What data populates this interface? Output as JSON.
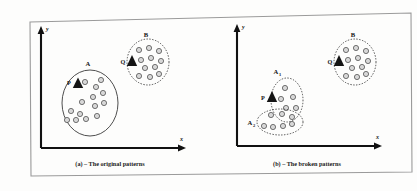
{
  "figure": {
    "outer_border_color": "#9a9a9a",
    "background_color": "#fdfdfc",
    "axis_color": "#111111",
    "dot_fill": "#d8d8d8",
    "dot_stroke": "#4a4a4a",
    "marker_fill": "#141414",
    "cluster_outline_color": "#3a3a3a"
  },
  "panels": [
    {
      "id": "panel-a",
      "caption": "(a) – The original patterns",
      "axes": {
        "y_label": "y",
        "x_label": "x"
      },
      "clusters": [
        {
          "name": "A",
          "shape": "ellipse",
          "outline": "solid",
          "cx": 90,
          "cy": 103,
          "rx": 28,
          "ry": 33,
          "label_x": 88,
          "label_y": 66,
          "points": [
            {
              "x": 85,
              "y": 82
            },
            {
              "x": 96,
              "y": 87
            },
            {
              "x": 101,
              "y": 80
            },
            {
              "x": 103,
              "y": 93
            },
            {
              "x": 93,
              "y": 97
            },
            {
              "x": 82,
              "y": 102
            },
            {
              "x": 95,
              "y": 106
            },
            {
              "x": 104,
              "y": 103
            },
            {
              "x": 71,
              "y": 111
            },
            {
              "x": 80,
              "y": 114
            },
            {
              "x": 67,
              "y": 120
            },
            {
              "x": 76,
              "y": 120
            },
            {
              "x": 86,
              "y": 119
            },
            {
              "x": 97,
              "y": 116
            }
          ],
          "marker": {
            "label": "P",
            "x": 78,
            "y": 83,
            "label_x": 69,
            "label_y": 84
          }
        },
        {
          "name": "B",
          "shape": "ellipse",
          "outline": "dotted",
          "cx": 148,
          "cy": 62,
          "rx": 21,
          "ry": 23,
          "label_x": 146,
          "label_y": 37,
          "points": [
            {
              "x": 139,
              "y": 50
            },
            {
              "x": 149,
              "y": 48
            },
            {
              "x": 159,
              "y": 51
            },
            {
              "x": 141,
              "y": 60
            },
            {
              "x": 151,
              "y": 58
            },
            {
              "x": 161,
              "y": 61
            },
            {
              "x": 145,
              "y": 68
            },
            {
              "x": 155,
              "y": 67
            },
            {
              "x": 139,
              "y": 76
            },
            {
              "x": 150,
              "y": 77
            },
            {
              "x": 159,
              "y": 74
            }
          ],
          "marker": {
            "label": "Q",
            "x": 132,
            "y": 61,
            "label_x": 122,
            "label_y": 63
          }
        }
      ]
    },
    {
      "id": "panel-b",
      "caption": "(b) – The broken patterns",
      "axes": {
        "y_label": "y",
        "x_label": "x"
      },
      "clusters": [
        {
          "name": "A",
          "subscript": "1",
          "shape": "ellipse",
          "outline": "dotted",
          "cx": 287,
          "cy": 100,
          "rx": 16,
          "ry": 22,
          "label_x": 278,
          "label_y": 72,
          "points": [
            {
              "x": 285,
              "y": 88
            },
            {
              "x": 281,
              "y": 99
            },
            {
              "x": 293,
              "y": 97
            },
            {
              "x": 286,
              "y": 108
            },
            {
              "x": 296,
              "y": 108
            }
          ],
          "marker": null
        },
        {
          "name": "A",
          "subscript": "2",
          "shape": "ellipse",
          "outline": "dotted",
          "cx": 280,
          "cy": 122,
          "rx": 23,
          "ry": 13,
          "label_x": 252,
          "label_y": 124,
          "points": [
            {
              "x": 271,
              "y": 115
            },
            {
              "x": 282,
              "y": 114
            },
            {
              "x": 292,
              "y": 117
            },
            {
              "x": 264,
              "y": 126
            },
            {
              "x": 273,
              "y": 127
            },
            {
              "x": 283,
              "y": 126
            },
            {
              "x": 292,
              "y": 124
            }
          ],
          "marker": null
        },
        {
          "name": "B",
          "shape": "ellipse",
          "outline": "dotted",
          "cx": 355,
          "cy": 62,
          "rx": 21,
          "ry": 23,
          "label_x": 353,
          "label_y": 37,
          "points": [
            {
              "x": 346,
              "y": 50
            },
            {
              "x": 356,
              "y": 48
            },
            {
              "x": 366,
              "y": 51
            },
            {
              "x": 348,
              "y": 60
            },
            {
              "x": 358,
              "y": 58
            },
            {
              "x": 368,
              "y": 61
            },
            {
              "x": 352,
              "y": 68
            },
            {
              "x": 362,
              "y": 67
            },
            {
              "x": 346,
              "y": 76
            },
            {
              "x": 357,
              "y": 77
            },
            {
              "x": 366,
              "y": 74
            }
          ],
          "marker": {
            "label": "Q",
            "x": 339,
            "y": 61,
            "label_x": 329,
            "label_y": 63
          }
        }
      ],
      "extra_markers": [
        {
          "label": "P",
          "x": 272,
          "y": 97,
          "label_x": 263,
          "label_y": 98
        }
      ]
    }
  ]
}
